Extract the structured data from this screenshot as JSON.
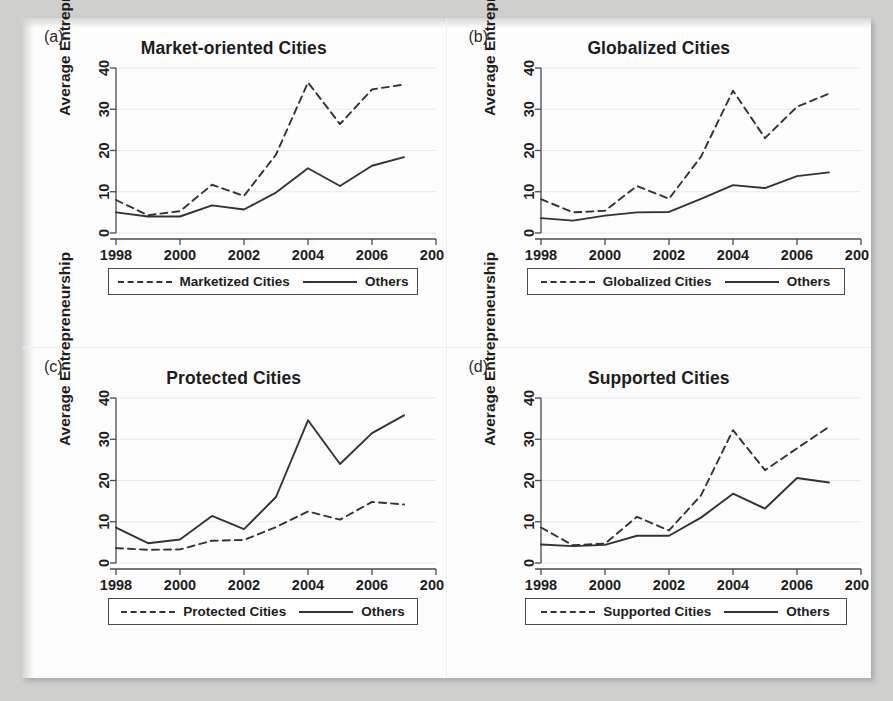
{
  "figure": {
    "background_color": "#cfcfcd",
    "paper_color": "#fdfdfd",
    "line_color": "#333333"
  },
  "axis": {
    "ylabel": "Average Entrepreneurship",
    "yticks": [
      "0",
      "10",
      "20",
      "30",
      "40"
    ],
    "xticks": [
      "1998",
      "2000",
      "2002",
      "2004",
      "2006",
      "2008"
    ],
    "ylim": [
      0,
      40
    ],
    "xlim": [
      1998,
      2008
    ],
    "grid": "horizontal"
  },
  "panels": [
    {
      "letter": "(a)",
      "title": "Market-oriented Cities",
      "legend": {
        "dashed": "Marketized Cities",
        "solid": "Others"
      }
    },
    {
      "letter": "(b)",
      "title": "Globalized Cities",
      "legend": {
        "dashed": "Globalized Cities",
        "solid": "Others"
      }
    },
    {
      "letter": "(c)",
      "title": "Protected Cities",
      "legend": {
        "dashed": "Protected Cities",
        "solid": "Others"
      }
    },
    {
      "letter": "(d)",
      "title": "Supported Cities",
      "legend": {
        "dashed": "Supported Cities",
        "solid": "Others"
      }
    }
  ],
  "chart_data": [
    {
      "type": "line",
      "panel": "(a)",
      "title": "Market-oriented Cities",
      "xlabel": "",
      "ylabel": "Average Entrepreneurship",
      "x": [
        1998,
        1999,
        2000,
        2001,
        2002,
        2003,
        2004,
        2005,
        2006,
        2007
      ],
      "xlim": [
        1998,
        2008
      ],
      "ylim": [
        0,
        40
      ],
      "grid": "horizontal",
      "legend_position": "below",
      "series": [
        {
          "name": "Marketized Cities",
          "style": "dashed",
          "values": [
            8.0,
            4.3,
            5.3,
            11.7,
            9.0,
            19.0,
            36.5,
            26.4,
            34.8,
            36.0
          ]
        },
        {
          "name": "Others",
          "style": "solid",
          "values": [
            5.0,
            4.0,
            4.0,
            6.7,
            5.7,
            9.8,
            15.7,
            11.4,
            16.3,
            18.4
          ]
        }
      ]
    },
    {
      "type": "line",
      "panel": "(b)",
      "title": "Globalized Cities",
      "xlabel": "",
      "ylabel": "Average Entrepreneurship",
      "x": [
        1998,
        1999,
        2000,
        2001,
        2002,
        2003,
        2004,
        2005,
        2006,
        2007
      ],
      "xlim": [
        1998,
        2008
      ],
      "ylim": [
        0,
        40
      ],
      "grid": "horizontal",
      "legend_position": "below",
      "series": [
        {
          "name": "Globalized Cities",
          "style": "dashed",
          "values": [
            8.2,
            5.0,
            5.4,
            11.4,
            8.3,
            18.5,
            34.5,
            23.0,
            30.6,
            33.8
          ]
        },
        {
          "name": "Others",
          "style": "solid",
          "values": [
            3.6,
            3.0,
            4.2,
            5.0,
            5.1,
            8.3,
            11.6,
            10.9,
            13.8,
            14.7
          ]
        }
      ]
    },
    {
      "type": "line",
      "panel": "(c)",
      "title": "Protected Cities",
      "xlabel": "",
      "ylabel": "Average Entrepreneurship",
      "x": [
        1998,
        1999,
        2000,
        2001,
        2002,
        2003,
        2004,
        2005,
        2006,
        2007
      ],
      "xlim": [
        1998,
        2008
      ],
      "ylim": [
        0,
        40
      ],
      "grid": "horizontal",
      "legend_position": "below",
      "series": [
        {
          "name": "Protected Cities",
          "style": "dashed",
          "values": [
            3.6,
            3.2,
            3.3,
            5.4,
            5.6,
            8.7,
            12.5,
            10.5,
            14.8,
            14.2
          ]
        },
        {
          "name": "Others",
          "style": "solid",
          "values": [
            8.6,
            4.8,
            5.7,
            11.4,
            8.2,
            16.0,
            34.6,
            24.0,
            31.5,
            35.8
          ]
        }
      ]
    },
    {
      "type": "line",
      "panel": "(d)",
      "title": "Supported Cities",
      "xlabel": "",
      "ylabel": "Average Entrepreneurship",
      "x": [
        1998,
        1999,
        2000,
        2001,
        2002,
        2003,
        2004,
        2005,
        2006,
        2007
      ],
      "xlim": [
        1998,
        2008
      ],
      "ylim": [
        0,
        40
      ],
      "grid": "horizontal",
      "legend_position": "below",
      "series": [
        {
          "name": "Supported Cities",
          "style": "dashed",
          "values": [
            8.6,
            4.3,
            4.7,
            11.2,
            7.9,
            16.4,
            32.2,
            22.5,
            27.8,
            33.0
          ]
        },
        {
          "name": "Others",
          "style": "solid",
          "values": [
            4.5,
            4.1,
            4.4,
            6.6,
            6.6,
            11.0,
            16.8,
            13.2,
            20.6,
            19.5
          ]
        }
      ]
    }
  ]
}
